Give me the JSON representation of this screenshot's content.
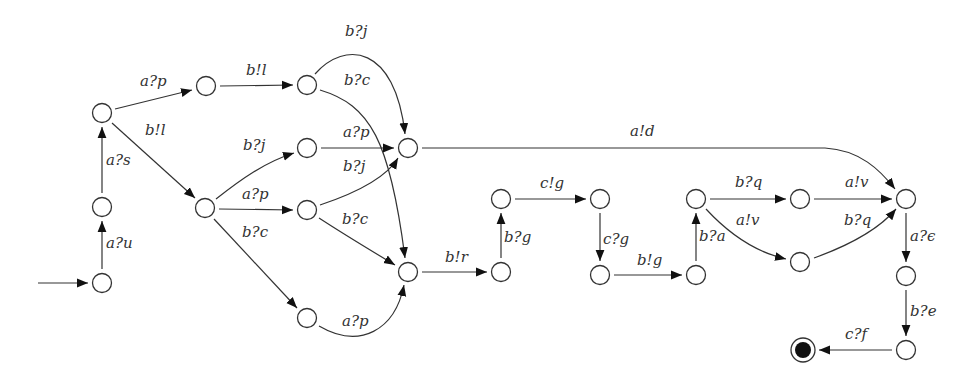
{
  "diagram": {
    "type": "state-machine",
    "nodes": [
      {
        "id": "n0",
        "x": 102,
        "y": 283,
        "initial": true
      },
      {
        "id": "n1",
        "x": 102,
        "y": 207
      },
      {
        "id": "n2",
        "x": 102,
        "y": 113
      },
      {
        "id": "n3",
        "x": 206,
        "y": 86
      },
      {
        "id": "n4",
        "x": 307,
        "y": 85
      },
      {
        "id": "n5",
        "x": 307,
        "y": 148
      },
      {
        "id": "n6",
        "x": 205,
        "y": 208
      },
      {
        "id": "n7",
        "x": 307,
        "y": 210
      },
      {
        "id": "n8",
        "x": 408,
        "y": 148
      },
      {
        "id": "n9",
        "x": 307,
        "y": 318
      },
      {
        "id": "n10",
        "x": 408,
        "y": 272
      },
      {
        "id": "n11",
        "x": 501,
        "y": 272
      },
      {
        "id": "n12",
        "x": 501,
        "y": 199
      },
      {
        "id": "n13",
        "x": 600,
        "y": 199
      },
      {
        "id": "n14",
        "x": 600,
        "y": 275
      },
      {
        "id": "n15",
        "x": 696,
        "y": 275
      },
      {
        "id": "n16",
        "x": 696,
        "y": 199
      },
      {
        "id": "n17",
        "x": 800,
        "y": 199
      },
      {
        "id": "n18",
        "x": 800,
        "y": 262
      },
      {
        "id": "n19",
        "x": 906,
        "y": 199
      },
      {
        "id": "n20",
        "x": 906,
        "y": 276
      },
      {
        "id": "n21",
        "x": 906,
        "y": 350
      },
      {
        "id": "nf",
        "x": 803,
        "y": 350,
        "final": true
      }
    ],
    "edges": [
      {
        "from": "n0",
        "to": "n1",
        "label": "a?u"
      },
      {
        "from": "n1",
        "to": "n2",
        "label": "a?s"
      },
      {
        "from": "n2",
        "to": "n3",
        "label": "a?p"
      },
      {
        "from": "n2",
        "to": "n6",
        "label": "b!l"
      },
      {
        "from": "n3",
        "to": "n4",
        "label": "b!l"
      },
      {
        "from": "n4",
        "to": "n8",
        "label": "b?j"
      },
      {
        "from": "n4",
        "to": "n10",
        "label": "b?c"
      },
      {
        "from": "n6",
        "to": "n5",
        "label": "b?j"
      },
      {
        "from": "n5",
        "to": "n8",
        "label": "a?p"
      },
      {
        "from": "n6",
        "to": "n7",
        "label": "a?p"
      },
      {
        "from": "n7",
        "to": "n8",
        "label": "b?j"
      },
      {
        "from": "n7",
        "to": "n10",
        "label": "b?c"
      },
      {
        "from": "n6",
        "to": "n9",
        "label": "b?c"
      },
      {
        "from": "n9",
        "to": "n10",
        "label": "a?p"
      },
      {
        "from": "n8",
        "to": "n19",
        "label": "a!d"
      },
      {
        "from": "n10",
        "to": "n11",
        "label": "b!r"
      },
      {
        "from": "n11",
        "to": "n12",
        "label": "b?g"
      },
      {
        "from": "n12",
        "to": "n13",
        "label": "c!g"
      },
      {
        "from": "n13",
        "to": "n14",
        "label": "c?g"
      },
      {
        "from": "n14",
        "to": "n15",
        "label": "b!g"
      },
      {
        "from": "n15",
        "to": "n16",
        "label": "b?a"
      },
      {
        "from": "n16",
        "to": "n17",
        "label": "b?q"
      },
      {
        "from": "n16",
        "to": "n18",
        "label": "a!v"
      },
      {
        "from": "n17",
        "to": "n19",
        "label": "a!v"
      },
      {
        "from": "n18",
        "to": "n19",
        "label": "b?q"
      },
      {
        "from": "n19",
        "to": "n20",
        "label": "a?ϵ"
      },
      {
        "from": "n20",
        "to": "n21",
        "label": "b?e"
      },
      {
        "from": "n21",
        "to": "nf",
        "label": "c?f"
      }
    ]
  },
  "labels": {
    "n0_n1": "a?u",
    "n1_n2": "a?s",
    "n2_n3": "a?p",
    "n2_n6": "b!l",
    "n3_n4": "b!l",
    "n4_n8": "b?j",
    "n4_n10": "b?c",
    "n6_n5": "b?j",
    "n5_n8": "a?p",
    "n6_n7": "a?p",
    "n7_n8": "b?j",
    "n7_n10": "b?c",
    "n6_n9": "b?c",
    "n9_n10": "a?p",
    "n8_n19": "a!d",
    "n10_n11": "b!r",
    "n11_n12": "b?g",
    "n12_n13": "c!g",
    "n13_n14": "c?g",
    "n14_n15": "b!g",
    "n15_n16": "b?a",
    "n16_n17": "b?q",
    "n16_n18": "a!v",
    "n17_n19": "a!v",
    "n18_n19": "b?q",
    "n19_n20": "a?ϵ",
    "n20_n21": "b?e",
    "n21_nf": "c?f"
  }
}
